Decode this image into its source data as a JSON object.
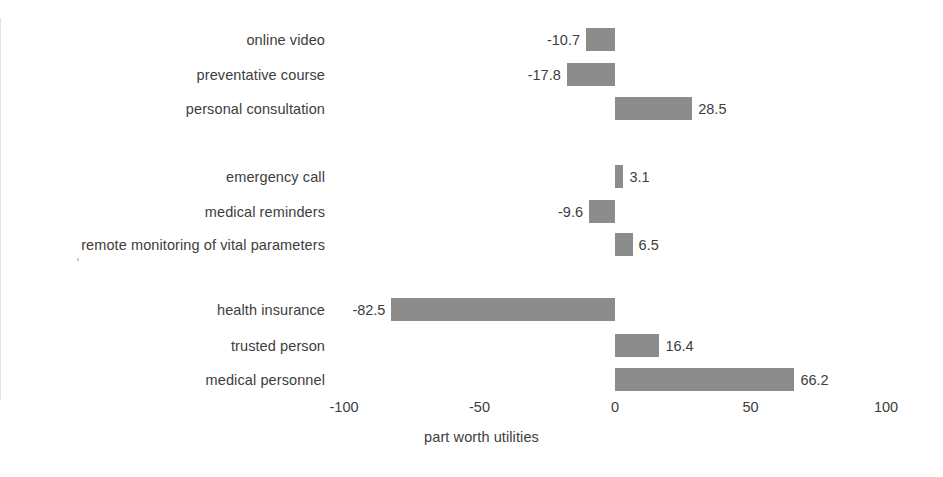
{
  "chart_data": {
    "type": "bar",
    "orientation": "horizontal",
    "title": "",
    "xlabel": "part worth utilities",
    "ylabel": "",
    "xlim": [
      -100,
      100
    ],
    "xticks": [
      -100,
      -50,
      0,
      50,
      100
    ],
    "xtick_labels": [
      "-100",
      "-50",
      "0",
      "50",
      "100"
    ],
    "grid": false,
    "legend": false,
    "bar_color": "#8c8c8c",
    "background_color": "#ffffff",
    "zero_line_color": "#e3e3e3",
    "categories": [
      "online video",
      "preventative course",
      "personal consultation",
      "emergency call",
      "medical reminders",
      "remote monitoring of vital parameters",
      "health insurance",
      "trusted person",
      "medical personnel"
    ],
    "values": [
      -10.7,
      -17.8,
      28.5,
      3.1,
      -9.6,
      6.5,
      -82.5,
      16.4,
      66.2
    ],
    "value_labels": [
      "-10.7",
      "-17.8",
      "28.5",
      "3.1",
      "-9.6",
      "6.5",
      "-82.5",
      "16.4",
      "66.2"
    ],
    "groups": [
      {
        "name": "group-1",
        "categories": [
          "online video",
          "preventative course",
          "personal consultation"
        ]
      },
      {
        "name": "group-2",
        "categories": [
          "emergency call",
          "medical reminders",
          "remote monitoring of vital parameters"
        ]
      },
      {
        "name": "group-3",
        "categories": [
          "health insurance",
          "trusted person",
          "medical personnel"
        ]
      }
    ]
  },
  "rows": [
    {
      "label": "online video",
      "value": -10.7,
      "value_label": "-10.7"
    },
    {
      "label": "preventative course",
      "value": -17.8,
      "value_label": "-17.8"
    },
    {
      "label": "personal consultation",
      "value": 28.5,
      "value_label": "28.5"
    },
    {
      "label": "emergency call",
      "value": 3.1,
      "value_label": "3.1"
    },
    {
      "label": "medical reminders",
      "value": -9.6,
      "value_label": "-9.6"
    },
    {
      "label": "remote monitoring of vital parameters",
      "value": 6.5,
      "value_label": "6.5"
    },
    {
      "label": "health insurance",
      "value": -82.5,
      "value_label": "-82.5"
    },
    {
      "label": "trusted person",
      "value": 16.4,
      "value_label": "16.4"
    },
    {
      "label": "medical personnel",
      "value": 66.2,
      "value_label": "66.2"
    }
  ],
  "axis": {
    "title": "part worth utilities",
    "ticks": [
      {
        "value": -100,
        "label": "-100"
      },
      {
        "value": -50,
        "label": "-50"
      },
      {
        "value": 0,
        "label": "0"
      },
      {
        "value": 50,
        "label": "50"
      },
      {
        "value": 100,
        "label": "100"
      }
    ]
  },
  "geometry": {
    "zero_x": 615,
    "px_per_unit": 2.71,
    "bar_height": 23,
    "row_tops": [
      28,
      63,
      97,
      165,
      200,
      233,
      298,
      334,
      368
    ]
  }
}
